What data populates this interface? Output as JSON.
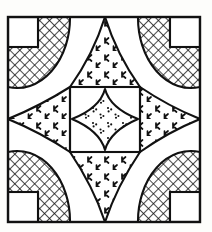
{
  "figure": {
    "name": "quilt-block-line-drawing",
    "canvas": {
      "width": 212,
      "height": 232,
      "background": "#fdfdfb"
    },
    "ink_color": "#111111",
    "stroke_width": 2.1,
    "frame": {
      "x": 8,
      "y": 17,
      "width": 192,
      "height": 205
    },
    "inner_square": {
      "x": 70,
      "y": 87,
      "width": 70,
      "height": 65
    },
    "corner_notch_size": 30,
    "corner_notches": [
      {
        "name": "corner-notch-top-left",
        "x": 8,
        "y": 17,
        "w": 30,
        "h": 30
      },
      {
        "name": "corner-notch-top-right",
        "x": 170,
        "y": 17,
        "w": 30,
        "h": 30
      },
      {
        "name": "corner-notch-bottom-left",
        "x": 8,
        "y": 192,
        "w": 30,
        "h": 30
      },
      {
        "name": "corner-notch-bottom-right",
        "x": 170,
        "y": 192,
        "w": 30,
        "h": 30
      }
    ],
    "petals": [
      {
        "name": "crosshatch-petal-top-left",
        "fill": "crosshatch"
      },
      {
        "name": "crosshatch-petal-top-right",
        "fill": "crosshatch"
      },
      {
        "name": "crosshatch-petal-bottom-left",
        "fill": "crosshatch"
      },
      {
        "name": "crosshatch-petal-bottom-right",
        "fill": "crosshatch"
      }
    ],
    "triangles": [
      {
        "name": "stipple-triangle-top",
        "fill": "tick-stipple"
      },
      {
        "name": "stipple-triangle-bottom",
        "fill": "tick-stipple"
      },
      {
        "name": "stipple-triangle-left",
        "fill": "tick-stipple"
      },
      {
        "name": "stipple-triangle-right",
        "fill": "tick-stipple"
      }
    ],
    "center_diamond": {
      "name": "stipple-center-diamond",
      "fill": "dot-stipple"
    },
    "fills": {
      "crosshatch": {
        "label": "crosshatch",
        "spacing": 7,
        "angle_deg": 45
      },
      "tick-stipple": {
        "label": "tick stipple",
        "glyph": "k-mark"
      },
      "dot-stipple": {
        "label": "dot stipple",
        "glyph": "dot-cluster"
      }
    }
  }
}
